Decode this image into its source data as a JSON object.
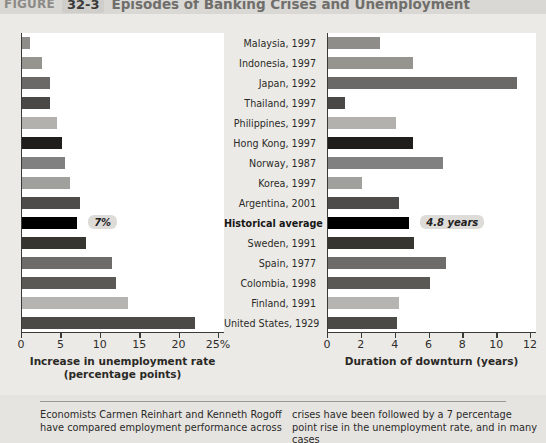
{
  "header": {
    "word": "FIGURE",
    "number": "32-3",
    "title": "Episodes of Banking Crises and Unemployment"
  },
  "chart_data": [
    {
      "type": "bar",
      "id": "left",
      "title": "Increase in unemployment rate (percentage points)",
      "xlabel_line1": "Increase in unemployment rate",
      "xlabel_line2": "(percentage points)",
      "ylabel": "",
      "orientation": "horizontal",
      "xlim": [
        0,
        25
      ],
      "ticks": [
        0,
        5,
        10,
        15,
        20,
        25
      ],
      "tick_labels": [
        "0",
        "5",
        "10",
        "15",
        "20",
        "25%"
      ],
      "grid": false,
      "legend": "none",
      "categories": [
        "Malaysia, 1997",
        "Indonesia, 1997",
        "Japan, 1992",
        "Thailand, 1997",
        "Philippines, 1997",
        "Hong Kong, 1997",
        "Norway, 1987",
        "Korea, 1997",
        "Argentina, 2001",
        "Historical average",
        "Sweden, 1991",
        "Spain, 1977",
        "Colombia, 1998",
        "Finland, 1991",
        "United States, 1929"
      ],
      "values": [
        1.0,
        2.6,
        3.5,
        3.6,
        4.4,
        5.1,
        5.5,
        6.1,
        7.3,
        7.0,
        8.1,
        11.4,
        11.9,
        13.4,
        22.0
      ],
      "colors": [
        "#8f8d8a",
        "#96948f",
        "#6b6967",
        "#4a4846",
        "#b3b1ad",
        "#1f1e1d",
        "#818080",
        "#a0a09c",
        "#4e4c4a",
        "#000000",
        "#37352f",
        "#6e6c6a",
        "#5b5956",
        "#b6b4b0",
        "#4c4a47"
      ],
      "annotation": {
        "label": "7%",
        "category": "Historical average",
        "value": 7.0
      }
    },
    {
      "type": "bar",
      "id": "right",
      "title": "Duration of downturn (years)",
      "xlabel_line1": "Duration of downturn (years)",
      "xlabel_line2": "",
      "ylabel": "",
      "orientation": "horizontal",
      "xlim": [
        0,
        12
      ],
      "ticks": [
        0,
        2,
        4,
        6,
        8,
        10,
        12
      ],
      "tick_labels": [
        "0",
        "2",
        "4",
        "6",
        "8",
        "10",
        "12"
      ],
      "grid": false,
      "legend": "none",
      "categories": [
        "Malaysia, 1997",
        "Indonesia, 1997",
        "Japan, 1992",
        "Thailand, 1997",
        "Philippines, 1997",
        "Hong Kong, 1997",
        "Norway, 1987",
        "Korea, 1997",
        "Argentina, 2001",
        "Historical average",
        "Sweden, 1991",
        "Spain, 1977",
        "Colombia, 1998",
        "Finland, 1991",
        "United States, 1929"
      ],
      "values": [
        3.1,
        5.0,
        11.2,
        1.0,
        4.0,
        5.0,
        6.8,
        2.0,
        4.2,
        4.8,
        5.1,
        7.0,
        6.0,
        4.2,
        4.1
      ],
      "colors": [
        "#8f8d8a",
        "#96948f",
        "#6b6967",
        "#4a4846",
        "#b3b1ad",
        "#1f1e1d",
        "#818080",
        "#a0a09c",
        "#4e4c4a",
        "#000000",
        "#37352f",
        "#6e6c6a",
        "#5b5956",
        "#b6b4b0",
        "#4c4a47"
      ],
      "annotation": {
        "label": "4.8 years",
        "category": "Historical average",
        "value": 4.8
      }
    }
  ],
  "caption": {
    "left": "Economists Carmen Reinhart and Kenneth Rogoff have compared employment performance across",
    "right": "crises have been followed by a 7 percentage point rise in the unemployment rate, and in many cases"
  }
}
